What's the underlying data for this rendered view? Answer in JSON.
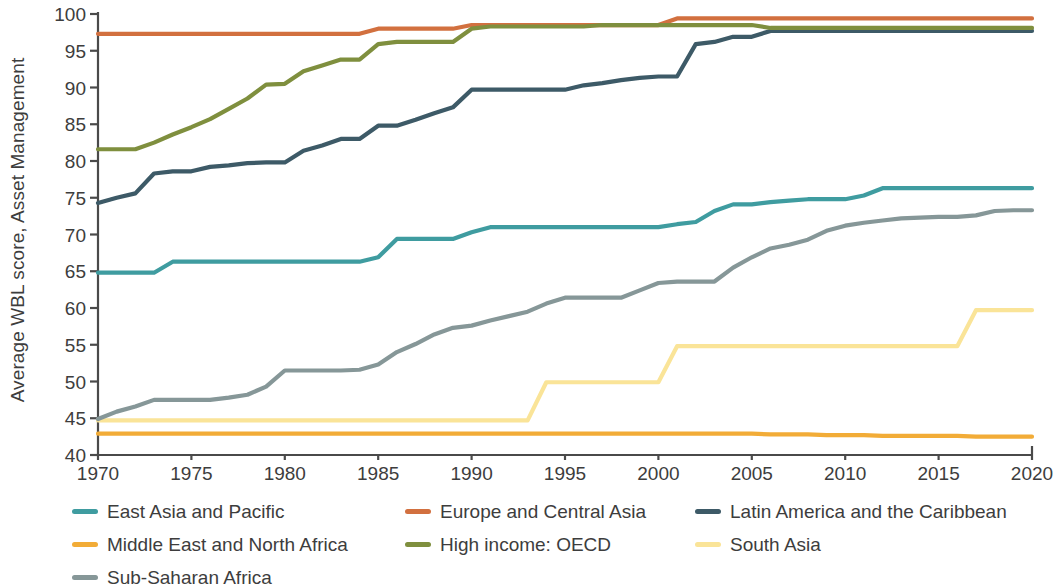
{
  "chart_data": {
    "type": "line",
    "title": "",
    "xlabel": "",
    "ylabel": "Average WBL score, Asset Management",
    "xlim": [
      1970,
      2020
    ],
    "ylim": [
      40,
      100
    ],
    "grid": false,
    "legend_position": "bottom",
    "xticks": [
      1970,
      1975,
      1980,
      1985,
      1990,
      1995,
      2000,
      2005,
      2010,
      2015,
      2020
    ],
    "yticks": [
      40,
      45,
      50,
      55,
      60,
      65,
      70,
      75,
      80,
      85,
      90,
      95,
      100
    ],
    "x": [
      1970,
      1971,
      1972,
      1973,
      1974,
      1975,
      1976,
      1977,
      1978,
      1979,
      1980,
      1981,
      1982,
      1983,
      1984,
      1985,
      1986,
      1987,
      1988,
      1989,
      1990,
      1991,
      1992,
      1993,
      1994,
      1995,
      1996,
      1997,
      1998,
      1999,
      2000,
      2001,
      2002,
      2003,
      2004,
      2005,
      2006,
      2007,
      2008,
      2009,
      2010,
      2011,
      2012,
      2013,
      2014,
      2015,
      2016,
      2017,
      2018,
      2019,
      2020
    ],
    "series": [
      {
        "name": "East Asia and Pacific",
        "color": "#3f9ca0",
        "values": [
          64.8,
          64.8,
          64.8,
          64.8,
          66.3,
          66.3,
          66.3,
          66.3,
          66.3,
          66.3,
          66.3,
          66.3,
          66.3,
          66.3,
          66.3,
          66.9,
          69.4,
          69.4,
          69.4,
          69.4,
          70.3,
          71.0,
          71.0,
          71.0,
          71.0,
          71.0,
          71.0,
          71.0,
          71.0,
          71.0,
          71.0,
          71.4,
          71.7,
          73.2,
          74.1,
          74.1,
          74.4,
          74.6,
          74.8,
          74.8,
          74.8,
          75.3,
          76.3,
          76.3,
          76.3,
          76.3,
          76.3,
          76.3,
          76.3,
          76.3,
          76.3
        ]
      },
      {
        "name": "Europe and Central Asia",
        "color": "#d2703f",
        "values": [
          97.3,
          97.3,
          97.3,
          97.3,
          97.3,
          97.3,
          97.3,
          97.3,
          97.3,
          97.3,
          97.3,
          97.3,
          97.3,
          97.3,
          97.3,
          98.0,
          98.0,
          98.0,
          98.0,
          98.0,
          98.5,
          98.5,
          98.5,
          98.5,
          98.5,
          98.5,
          98.5,
          98.5,
          98.5,
          98.5,
          98.5,
          99.4,
          99.4,
          99.4,
          99.4,
          99.4,
          99.4,
          99.4,
          99.4,
          99.4,
          99.4,
          99.4,
          99.4,
          99.4,
          99.4,
          99.4,
          99.4,
          99.4,
          99.4,
          99.4,
          99.4
        ]
      },
      {
        "name": "Latin America and the Caribbean",
        "color": "#3d5a67",
        "values": [
          74.3,
          75.0,
          75.6,
          78.3,
          78.6,
          78.6,
          79.2,
          79.4,
          79.7,
          79.8,
          79.8,
          81.4,
          82.1,
          83.0,
          83.0,
          84.8,
          84.8,
          85.6,
          86.5,
          87.3,
          89.7,
          89.7,
          89.7,
          89.7,
          89.7,
          89.7,
          90.3,
          90.6,
          91.0,
          91.3,
          91.5,
          91.5,
          95.9,
          96.2,
          96.9,
          96.9,
          97.7,
          97.7,
          97.7,
          97.7,
          97.7,
          97.7,
          97.7,
          97.7,
          97.7,
          97.7,
          97.7,
          97.7,
          97.7,
          97.7,
          97.7
        ]
      },
      {
        "name": "Middle East and North Africa",
        "color": "#f2ac37",
        "values": [
          42.9,
          42.9,
          42.9,
          42.9,
          42.9,
          42.9,
          42.9,
          42.9,
          42.9,
          42.9,
          42.9,
          42.9,
          42.9,
          42.9,
          42.9,
          42.9,
          42.9,
          42.9,
          42.9,
          42.9,
          42.9,
          42.9,
          42.9,
          42.9,
          42.9,
          42.9,
          42.9,
          42.9,
          42.9,
          42.9,
          42.9,
          42.9,
          42.9,
          42.9,
          42.9,
          42.9,
          42.8,
          42.8,
          42.8,
          42.7,
          42.7,
          42.7,
          42.6,
          42.6,
          42.6,
          42.6,
          42.6,
          42.5,
          42.5,
          42.5,
          42.5
        ]
      },
      {
        "name": "High income: OECD",
        "color": "#7f8f3e",
        "values": [
          81.6,
          81.6,
          81.6,
          82.5,
          83.6,
          84.6,
          85.7,
          87.1,
          88.5,
          90.4,
          90.5,
          92.2,
          93.0,
          93.8,
          93.8,
          95.9,
          96.2,
          96.2,
          96.2,
          96.2,
          98.0,
          98.3,
          98.3,
          98.3,
          98.3,
          98.3,
          98.3,
          98.5,
          98.5,
          98.5,
          98.5,
          98.5,
          98.5,
          98.5,
          98.5,
          98.5,
          98.1,
          98.1,
          98.1,
          98.1,
          98.1,
          98.1,
          98.1,
          98.1,
          98.1,
          98.1,
          98.1,
          98.1,
          98.1,
          98.1,
          98.1
        ]
      },
      {
        "name": "South Asia",
        "color": "#fae498",
        "values": [
          44.7,
          44.7,
          44.7,
          44.7,
          44.7,
          44.7,
          44.7,
          44.7,
          44.7,
          44.7,
          44.7,
          44.7,
          44.7,
          44.7,
          44.7,
          44.7,
          44.7,
          44.7,
          44.7,
          44.7,
          44.7,
          44.7,
          44.7,
          44.7,
          49.9,
          49.9,
          49.9,
          49.9,
          49.9,
          49.9,
          49.9,
          54.8,
          54.8,
          54.8,
          54.8,
          54.8,
          54.8,
          54.8,
          54.8,
          54.8,
          54.8,
          54.8,
          54.8,
          54.8,
          54.8,
          54.8,
          54.8,
          59.7,
          59.7,
          59.7,
          59.7
        ]
      },
      {
        "name": "Sub-Saharan Africa",
        "color": "#869798",
        "values": [
          44.9,
          45.9,
          46.6,
          47.5,
          47.5,
          47.5,
          47.5,
          47.8,
          48.2,
          49.3,
          51.5,
          51.5,
          51.5,
          51.5,
          51.6,
          52.3,
          54.0,
          55.1,
          56.4,
          57.3,
          57.6,
          58.3,
          58.9,
          59.5,
          60.6,
          61.4,
          61.4,
          61.4,
          61.4,
          62.4,
          63.4,
          63.6,
          63.6,
          63.6,
          65.5,
          66.9,
          68.1,
          68.6,
          69.3,
          70.5,
          71.2,
          71.6,
          71.9,
          72.2,
          72.3,
          72.4,
          72.4,
          72.6,
          73.2,
          73.3,
          73.3
        ]
      }
    ]
  },
  "legend": {
    "items": [
      {
        "label": "East Asia and Pacific",
        "color": "#3f9ca0"
      },
      {
        "label": "Europe and Central Asia",
        "color": "#d2703f"
      },
      {
        "label": "Latin America and the Caribbean",
        "color": "#3d5a67"
      },
      {
        "label": "Middle East and North Africa",
        "color": "#f2ac37"
      },
      {
        "label": "High income: OECD",
        "color": "#7f8f3e"
      },
      {
        "label": "South Asia",
        "color": "#fae498"
      },
      {
        "label": "Sub-Saharan Africa",
        "color": "#869798"
      }
    ]
  },
  "axes": {
    "y_title": "Average WBL score, Asset Management",
    "y_tick_labels": [
      "100",
      "95",
      "90",
      "85",
      "80",
      "75",
      "70",
      "65",
      "60",
      "55",
      "50",
      "45",
      "40"
    ],
    "x_tick_labels": [
      "1970",
      "1975",
      "1980",
      "1985",
      "1990",
      "1995",
      "2000",
      "2005",
      "2010",
      "2015",
      "2020"
    ]
  }
}
